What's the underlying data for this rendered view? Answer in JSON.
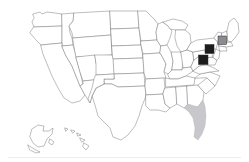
{
  "widget": {
    "title": "United States Map",
    "type": "choropleth-map",
    "region": "United States of America",
    "projection": "albers-usa",
    "background_color": "#ffffff",
    "outline_color": "#6e6e72",
    "footer_rule_color": "#ededf0"
  },
  "legend": {
    "visible": false,
    "entries": [
      {
        "label": "Selected",
        "color": "#1c1c1c"
      },
      {
        "label": "Secondary",
        "color": "#8c8c90"
      },
      {
        "label": "Tertiary",
        "color": "#c8c8cc"
      }
    ]
  },
  "chart_data": {
    "type": "heatmap",
    "title": "United States Map",
    "xlabel": "",
    "ylabel": "",
    "categories": [
      "Vermont / New Hampshire",
      "New York",
      "Pennsylvania",
      "Florida"
    ],
    "values": [
      2,
      3,
      3,
      1
    ],
    "markers": [
      {
        "id": "marker-northern-new-england",
        "label": "Vermont / New Hampshire",
        "color": "#8c8c90",
        "shape": "square",
        "x": 218.0,
        "y": 36.0,
        "size": 8.5
      },
      {
        "id": "marker-new-york",
        "label": "New York",
        "color": "#1c1c1c",
        "shape": "square",
        "x": 205.0,
        "y": 44.5,
        "size": 9.0
      },
      {
        "id": "marker-pennsylvania",
        "label": "Pennsylvania",
        "color": "#1c1c1c",
        "shape": "square",
        "x": 198.5,
        "y": 55.0,
        "size": 9.5
      }
    ],
    "shaded_regions": [
      {
        "id": "region-florida",
        "label": "Florida",
        "color": "#c8c8cc",
        "value": 1
      }
    ],
    "grid": false,
    "legend_position": "none",
    "colorscale": [
      "#ffffff",
      "#c8c8cc",
      "#8c8c90",
      "#1c1c1c"
    ]
  },
  "insets": [
    {
      "id": "inset-alaska",
      "label": "Alaska"
    },
    {
      "id": "inset-hawaii",
      "label": "Hawaii"
    }
  ]
}
